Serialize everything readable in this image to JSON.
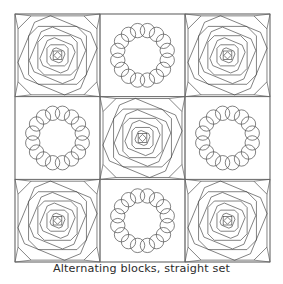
{
  "figure": {
    "title": "Alternating blocks, straight set",
    "caption": "Alternating blocks, straight set",
    "type": "quilt-layout-diagram",
    "background_color": "#ffffff",
    "line_color": "#3f3f3f",
    "grid_line_color": "#6e6e6e",
    "caption_color": "#2b2b2b"
  },
  "quilt": {
    "rows": 3,
    "columns": 3,
    "block_count": 9,
    "set_type": "straight set",
    "arrangement": "alternating",
    "grid": {
      "x": 15,
      "y": 14,
      "width": 255,
      "height": 248,
      "cell_width": 85,
      "cell_height": 82.667
    },
    "block_types": [
      {
        "id": "pineapple",
        "name": "Pineapple block",
        "description": "Concentric octagons with alternating rotation, center square on point",
        "ring_count": 7
      },
      {
        "id": "circle-wreath",
        "name": "Circle wreath block",
        "description": "Ring of sixteen overlapping circles",
        "circle_count": 16,
        "ring_radius_ratio": 0.305,
        "circle_radius_ratio": 0.087
      }
    ],
    "blocks": [
      {
        "row": 0,
        "col": 0,
        "type": "pineapple",
        "label": "block-r0-c0"
      },
      {
        "row": 0,
        "col": 1,
        "type": "circle-wreath",
        "label": "block-r0-c1"
      },
      {
        "row": 0,
        "col": 2,
        "type": "pineapple",
        "label": "block-r0-c2"
      },
      {
        "row": 1,
        "col": 0,
        "type": "circle-wreath",
        "label": "block-r1-c0"
      },
      {
        "row": 1,
        "col": 1,
        "type": "pineapple",
        "label": "block-r1-c1"
      },
      {
        "row": 1,
        "col": 2,
        "type": "circle-wreath",
        "label": "block-r1-c2"
      },
      {
        "row": 2,
        "col": 0,
        "type": "pineapple",
        "label": "block-r2-c0"
      },
      {
        "row": 2,
        "col": 1,
        "type": "circle-wreath",
        "label": "block-r2-c1"
      },
      {
        "row": 2,
        "col": 2,
        "type": "pineapple",
        "label": "block-r2-c2"
      }
    ]
  }
}
